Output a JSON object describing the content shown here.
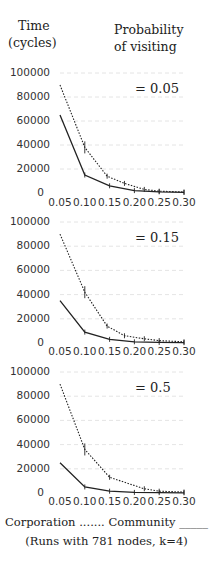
{
  "header": {
    "y_label_line1": "Time",
    "y_label_line2": "(cycles)",
    "param_label_line1": "Probability",
    "param_label_line2": "of visiting"
  },
  "legend": {
    "line1": "Corporation ....... Community _____",
    "line2": "(Runs with 781 nodes, k=4)"
  },
  "colors": {
    "line": "#222222",
    "grid": "#dddddd",
    "text": "#222222"
  },
  "chart_data": [
    {
      "type": "line",
      "title": "= 0.05",
      "xlabel": "",
      "ylabel": "Time (cycles)",
      "x_ticks": [
        "0.05",
        "0.10",
        "0.15",
        "0.20",
        "0.25",
        "0.30"
      ],
      "y_ticks": [
        "100000",
        "80000",
        "60000",
        "40000",
        "20000",
        "0"
      ],
      "xlim": [
        0.05,
        0.3
      ],
      "ylim": [
        0,
        100000
      ],
      "grid": true,
      "series": [
        {
          "name": "Corporation",
          "style": "dotted",
          "x": [
            0.05,
            0.1,
            0.145,
            0.18,
            0.22,
            0.25,
            0.3
          ],
          "values": [
            90000,
            38000,
            14000,
            8000,
            3000,
            1500,
            800
          ]
        },
        {
          "name": "Community",
          "style": "solid",
          "x": [
            0.05,
            0.1,
            0.15,
            0.2,
            0.25,
            0.3
          ],
          "values": [
            65000,
            15000,
            6000,
            2000,
            1000,
            500
          ]
        }
      ]
    },
    {
      "type": "line",
      "title": "= 0.15",
      "xlabel": "",
      "ylabel": "Time (cycles)",
      "x_ticks": [
        "0.05",
        "0.10",
        "0.15",
        "0.20",
        "0.25",
        "0.30"
      ],
      "y_ticks": [
        "100000",
        "80000",
        "60000",
        "40000",
        "20000",
        "0"
      ],
      "xlim": [
        0.05,
        0.3
      ],
      "ylim": [
        0,
        100000
      ],
      "grid": true,
      "series": [
        {
          "name": "Corporation",
          "style": "dotted",
          "x": [
            0.05,
            0.1,
            0.145,
            0.18,
            0.22,
            0.25,
            0.3
          ],
          "values": [
            90000,
            42000,
            14000,
            6000,
            3500,
            2000,
            1000
          ]
        },
        {
          "name": "Community",
          "style": "solid",
          "x": [
            0.05,
            0.1,
            0.15,
            0.2,
            0.25,
            0.3
          ],
          "values": [
            35000,
            9000,
            3000,
            1000,
            500,
            300
          ]
        }
      ]
    },
    {
      "type": "line",
      "title": "= 0.5",
      "xlabel": "",
      "ylabel": "Time (cycles)",
      "x_ticks": [
        "0.05",
        "0.10",
        "0.15",
        "0.20",
        "0.25",
        "0.30"
      ],
      "y_ticks": [
        "100000",
        "80000",
        "60000",
        "40000",
        "20000",
        "0"
      ],
      "xlim": [
        0.05,
        0.3
      ],
      "ylim": [
        0,
        100000
      ],
      "grid": true,
      "series": [
        {
          "name": "Corporation",
          "style": "dotted",
          "x": [
            0.05,
            0.1,
            0.15,
            0.22,
            0.25,
            0.3
          ],
          "values": [
            90000,
            36000,
            13000,
            3500,
            1500,
            800
          ]
        },
        {
          "name": "Community",
          "style": "solid",
          "x": [
            0.05,
            0.1,
            0.15,
            0.2,
            0.25,
            0.3
          ],
          "values": [
            25000,
            5000,
            1500,
            500,
            300,
            200
          ]
        }
      ]
    }
  ]
}
